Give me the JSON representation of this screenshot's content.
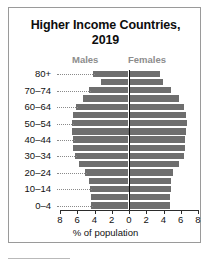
{
  "figure": {
    "title_line1": "Higher Income Countries,",
    "title_line2": "2019"
  },
  "chart_data": {
    "type": "bar",
    "subtype": "population-pyramid",
    "title": "Higher Income Countries, 2019",
    "xlabel": "% of population",
    "ylabel": "",
    "categories": [
      "0–4",
      "5–9",
      "10–14",
      "15–19",
      "20–24",
      "25–29",
      "30–34",
      "35–39",
      "40–44",
      "45–49",
      "50–54",
      "55–59",
      "60–64",
      "65–69",
      "70–74",
      "75–79",
      "80+"
    ],
    "visible_tick_labels": [
      "0–4",
      "10–14",
      "20–24",
      "30–34",
      "40–44",
      "50–54",
      "60–64",
      "70–74",
      "80+"
    ],
    "series": [
      {
        "name": "Males",
        "color": "#6e6e6e",
        "direction": "left",
        "values": [
          4.3,
          4.4,
          4.5,
          4.6,
          5.1,
          5.7,
          6.2,
          6.4,
          6.4,
          6.5,
          6.6,
          6.4,
          6.1,
          5.3,
          4.6,
          3.2,
          4.1
        ]
      },
      {
        "name": "Females",
        "color": "#6e6e6e",
        "direction": "right",
        "values": [
          4.8,
          4.8,
          4.9,
          4.9,
          5.2,
          5.8,
          6.4,
          6.6,
          6.6,
          6.7,
          6.8,
          6.7,
          6.4,
          5.8,
          4.9,
          4.0,
          3.6
        ]
      }
    ],
    "xticks": [
      8,
      6,
      4,
      2,
      0,
      2,
      4,
      6,
      8
    ],
    "xlim": [
      -8,
      8
    ],
    "grid": false,
    "legend": [
      "Males",
      "Females"
    ],
    "legend_position": "above-plot",
    "axis_color": "#2b2b2b",
    "label_color": "#8d8d8d"
  },
  "labels": {
    "males": "Males",
    "females": "Females",
    "x_axis_title": "% of population"
  }
}
